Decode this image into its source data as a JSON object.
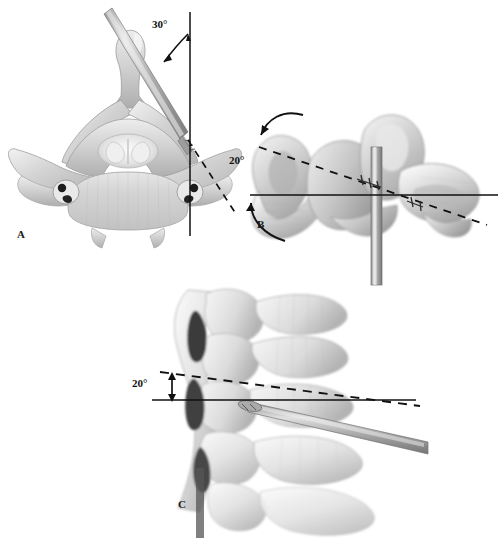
{
  "figure": {
    "background_color": "#ffffff",
    "line_color": "#111111",
    "bone_color": "#d8d8d8",
    "width": 503,
    "height": 538
  },
  "panels": [
    {
      "id": "A",
      "letter": "A",
      "view": "axial-cervical-vertebra",
      "description": "Axial view of cervical vertebra with drill guide entering lateral mass",
      "angle_label": "30°",
      "angle_value": 30,
      "angle_reference": "sagittal-midline-vertical",
      "reference_line": "solid-vertical",
      "trajectory_line": "dashed-oblique",
      "instrument": "drill-bit"
    },
    {
      "id": "B",
      "letter": "B",
      "view": "posterior-oblique-vertebra",
      "description": "Posterior view of vertebra with vertical drill shaft and rotation arrows",
      "angle_label": "20°",
      "angle_value": 20,
      "angle_reference": "transverse-horizontal",
      "reference_line": "solid-horizontal",
      "trajectory_line": "dashed-oblique",
      "instrument": "drill-shaft"
    },
    {
      "id": "C",
      "letter": "C",
      "view": "lateral-cervical-spine",
      "description": "Lateral view of cervical spine with drill entering at cephalad angle",
      "angle_label": "20°",
      "angle_value": 20,
      "angle_reference": "transverse-horizontal",
      "reference_line": "solid-horizontal",
      "trajectory_line": "dashed-oblique",
      "instrument": "drill-bit"
    }
  ],
  "annotations": {
    "arrow_style": "curved-single-headed",
    "panel_b_arrows": [
      "rotation-arrow-upper",
      "rotation-arrow-lower"
    ],
    "panel_c_arrow": "double-headed-vertical"
  }
}
